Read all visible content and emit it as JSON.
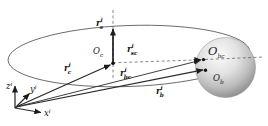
{
  "diagram": {
    "description_hint": "inertial-frame orbit geometry with spacecraft point, celestial body sphere and position vectors",
    "axis_labels": {
      "x": {
        "base": "x",
        "sup": "i"
      },
      "y": {
        "base": "y",
        "sup": "i"
      },
      "z": {
        "base": "z",
        "sup": "i"
      }
    },
    "point_labels": {
      "observer": {
        "base": "O",
        "sub": "c"
      },
      "body_center": {
        "base": "O",
        "sub": "bc"
      },
      "body": {
        "base": "O",
        "sub": "b"
      }
    },
    "vector_labels": {
      "up_vector": {
        "base": "r",
        "sup": "i",
        "sub": "s"
      },
      "to_observer": {
        "base": "r",
        "sup": "i",
        "sub": "c"
      },
      "observer_to_body": {
        "base": "r",
        "sup": "i",
        "sub": "sc"
      },
      "to_body_center": {
        "base": "r",
        "sup": "i",
        "sub": "bc"
      },
      "to_body": {
        "base": "r",
        "sup": "i",
        "sub": "b"
      }
    },
    "colors": {
      "ink": "#2a2a2a",
      "construction_line": "#555555",
      "orbit_line": "#4a4a4a",
      "sphere_highlight": "#fbfbfb",
      "sphere_mid": "#cfcfcf",
      "sphere_shadow": "#878787",
      "background": "#ffffff"
    }
  }
}
